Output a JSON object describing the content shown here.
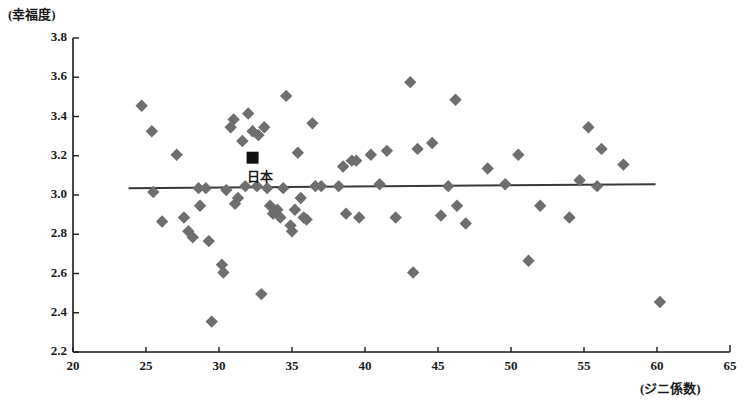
{
  "chart_data": {
    "type": "scatter",
    "title": "",
    "xlabel": "(ジニ係数)",
    "ylabel": "(幸福度)",
    "xlim": [
      20,
      65
    ],
    "ylim": [
      2.2,
      3.8
    ],
    "xticks": [
      20,
      25,
      30,
      35,
      40,
      45,
      50,
      55,
      60,
      65
    ],
    "yticks": [
      "2.2",
      "2.4",
      "2.6",
      "2.8",
      "3.0",
      "3.2",
      "3.4",
      "3.6",
      "3.8"
    ],
    "grid": false,
    "legend": null,
    "marker_color": "#6e6e6e",
    "marker_shape": "diamond",
    "highlight_color": "#111111",
    "trendline": {
      "color": "#3a3a3a",
      "x_start": 23.8,
      "y_start": 3.035,
      "x_end": 59.9,
      "y_end": 3.055
    },
    "annotations": [
      {
        "label": "日本",
        "x": 32.3,
        "y": 3.19,
        "marker": "square",
        "color": "#111111"
      }
    ],
    "series": [
      {
        "name": "countries",
        "points": [
          [
            24.7,
            3.455
          ],
          [
            25.4,
            3.325
          ],
          [
            25.5,
            3.015
          ],
          [
            26.1,
            2.865
          ],
          [
            27.1,
            3.205
          ],
          [
            27.6,
            2.885
          ],
          [
            27.9,
            2.815
          ],
          [
            28.2,
            2.785
          ],
          [
            28.6,
            3.035
          ],
          [
            28.7,
            2.945
          ],
          [
            29.1,
            3.035
          ],
          [
            29.3,
            2.765
          ],
          [
            29.5,
            2.355
          ],
          [
            30.2,
            2.645
          ],
          [
            30.3,
            2.605
          ],
          [
            30.5,
            3.025
          ],
          [
            30.8,
            3.345
          ],
          [
            31.0,
            3.385
          ],
          [
            31.1,
            2.955
          ],
          [
            31.3,
            2.985
          ],
          [
            31.6,
            3.275
          ],
          [
            31.8,
            3.045
          ],
          [
            32.0,
            3.415
          ],
          [
            32.3,
            3.325
          ],
          [
            32.6,
            3.045
          ],
          [
            32.7,
            3.305
          ],
          [
            32.9,
            2.495
          ],
          [
            33.1,
            3.345
          ],
          [
            33.3,
            3.035
          ],
          [
            33.5,
            2.945
          ],
          [
            33.7,
            2.905
          ],
          [
            34.0,
            2.925
          ],
          [
            34.2,
            2.885
          ],
          [
            34.4,
            3.035
          ],
          [
            34.6,
            3.505
          ],
          [
            34.9,
            2.845
          ],
          [
            35.0,
            2.815
          ],
          [
            35.2,
            2.925
          ],
          [
            35.4,
            3.215
          ],
          [
            35.6,
            2.985
          ],
          [
            35.8,
            2.885
          ],
          [
            36.0,
            2.875
          ],
          [
            36.4,
            3.365
          ],
          [
            36.6,
            3.045
          ],
          [
            37.0,
            3.045
          ],
          [
            38.2,
            3.045
          ],
          [
            38.5,
            3.145
          ],
          [
            38.7,
            2.905
          ],
          [
            39.1,
            3.175
          ],
          [
            39.4,
            3.175
          ],
          [
            39.6,
            2.885
          ],
          [
            40.4,
            3.205
          ],
          [
            41.0,
            3.055
          ],
          [
            41.5,
            3.225
          ],
          [
            42.1,
            2.885
          ],
          [
            43.1,
            3.575
          ],
          [
            43.3,
            2.605
          ],
          [
            43.6,
            3.235
          ],
          [
            44.6,
            3.265
          ],
          [
            45.2,
            2.895
          ],
          [
            45.7,
            3.045
          ],
          [
            46.2,
            3.485
          ],
          [
            46.3,
            2.945
          ],
          [
            46.9,
            2.855
          ],
          [
            48.4,
            3.135
          ],
          [
            49.6,
            3.055
          ],
          [
            50.5,
            3.205
          ],
          [
            51.2,
            2.665
          ],
          [
            52.0,
            2.945
          ],
          [
            54.0,
            2.885
          ],
          [
            54.7,
            3.075
          ],
          [
            55.3,
            3.345
          ],
          [
            55.9,
            3.045
          ],
          [
            56.2,
            3.235
          ],
          [
            57.7,
            3.155
          ],
          [
            60.2,
            2.455
          ]
        ]
      }
    ]
  }
}
